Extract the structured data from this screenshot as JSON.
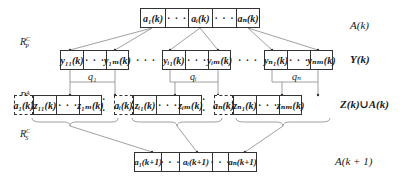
{
  "top_row": {
    "cells": [
      "a₁(k)",
      "· · ·",
      "aᵢ(k)",
      "· · ·",
      "aₙ(k)"
    ],
    "label": "A(k)"
  },
  "y_row": {
    "groups": [
      {
        "cells": [
          "y₁₁(k)",
          "· · ·",
          "y₁ₘ(k)"
        ],
        "q": "q₁"
      },
      {
        "cells": [
          "yᵢ₁(k)",
          "· · ·",
          "yᵢₘ(k)"
        ],
        "q": "qᵢ"
      },
      {
        "cells": [
          "yₙ₁(k)",
          "· · ·",
          "yₙₘ(k)"
        ],
        "q": "qₙ"
      }
    ],
    "between": "· · ·",
    "label": "Y(k)"
  },
  "z_row": {
    "groups": [
      {
        "prefix": "a₁(k)",
        "cells": [
          "z₁₁(k)",
          "· · ·",
          "z₁ₘ(k)"
        ]
      },
      {
        "prefix": "aᵢ(k)",
        "cells": [
          "zᵢ₁(k)",
          "· · ·",
          "zᵢₘ(k)"
        ]
      },
      {
        "prefix": "aₙ(k)",
        "cells": [
          "zₙ₁(k)",
          "· · ·",
          "zₙₘ(k)"
        ]
      }
    ],
    "between": "· ·",
    "label": "Z(k)∪A(k)"
  },
  "bottom_row": {
    "cells": [
      "a₁(k+1)",
      "· · ·",
      "aᵢ(k+1)",
      "· · ·",
      "aₙ(k+1)"
    ],
    "label": "A(k + 1)"
  },
  "operators": {
    "recombination": {
      "base": "R",
      "sup": "C",
      "sub": "P"
    },
    "mutation": {
      "base": "R",
      "sup": "A",
      "sub": "M"
    },
    "selection": {
      "base": "R",
      "sup": "C",
      "sub": "S"
    }
  }
}
